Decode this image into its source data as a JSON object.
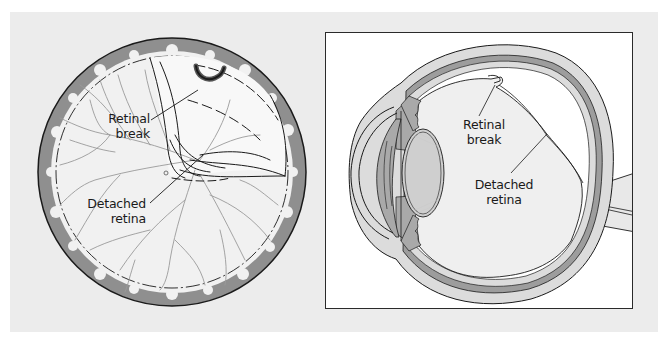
{
  "figure": {
    "colors": {
      "background": "#ececec",
      "frame": "#2a2a2a",
      "choroid_gray": "#8f8f8f",
      "retina_fill": "#f3f3f3",
      "vessel": "#9a9a9a",
      "outline": "#1a1a1a",
      "lens_fill": "#cfcfcf",
      "iris_fill": "#a9a9a9",
      "sclera_band": "#dcdcdc"
    },
    "left_panel": {
      "title": "Fundus view",
      "labels": {
        "retinal_break_line1": "Retinal",
        "retinal_break_line2": "break",
        "detached_retina_line1": "Detached",
        "detached_retina_line2": "retina"
      }
    },
    "right_panel": {
      "title": "Cross-section of eye",
      "labels": {
        "retinal_break_line1": "Retinal",
        "retinal_break_line2": "break",
        "detached_retina_line1": "Detached",
        "detached_retina_line2": "retina"
      }
    }
  }
}
